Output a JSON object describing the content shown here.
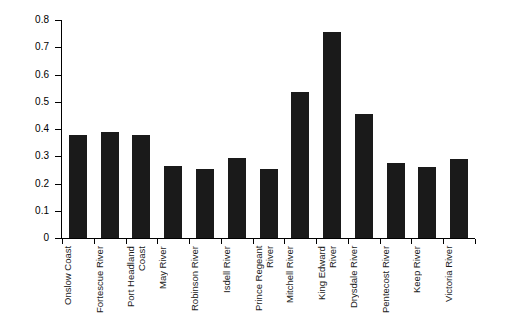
{
  "chart_data": {
    "type": "bar",
    "title": "",
    "subtitle": "",
    "xlabel": "",
    "ylabel": "",
    "ylim": [
      0,
      0.8
    ],
    "ytick_labels": [
      "0.8",
      "0.7",
      "0.6",
      "0.5",
      "0.4",
      "0.3",
      "0.2",
      "0.1",
      "0"
    ],
    "ytick_values": [
      0.8,
      0.7,
      0.6,
      0.5,
      0.4,
      0.3,
      0.2,
      0.1,
      0
    ],
    "grid": false,
    "legend": "none",
    "bar_color": "#1a1a1a",
    "categories": [
      "Onslow Coast",
      "Fortescue River",
      "Port Headland Coast",
      "May River",
      "Robinson River",
      "Isdell River",
      "Prince Regeant River",
      "Mitchell River",
      "King Edward River",
      "Drysdale River",
      "Pentecost River",
      "Keep River",
      "Victoria River"
    ],
    "values": [
      0.378,
      0.39,
      0.378,
      0.265,
      0.255,
      0.295,
      0.255,
      0.535,
      0.755,
      0.455,
      0.275,
      0.26,
      0.29
    ]
  }
}
